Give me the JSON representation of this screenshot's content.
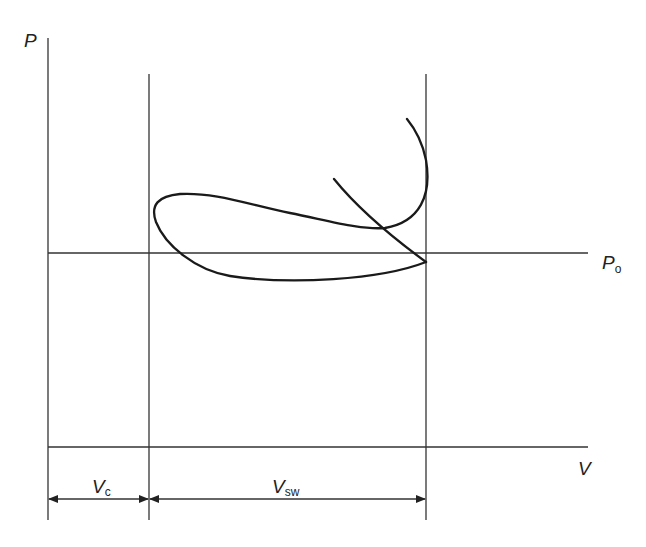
{
  "diagram": {
    "axes": {
      "y_label": "P",
      "x_label": "V",
      "reference_pressure": {
        "main": "P",
        "sub": "o"
      }
    },
    "dimensions": {
      "clearance": {
        "main": "V",
        "sub": "c"
      },
      "swept": {
        "main": "V",
        "sub": "sw"
      }
    },
    "colors": {
      "line": "#333333",
      "curve": "#1a1a1a",
      "background": "#ffffff"
    }
  }
}
